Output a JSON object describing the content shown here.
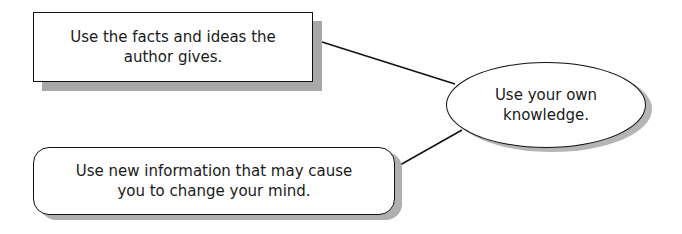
{
  "diagram": {
    "top_box": {
      "shape": "rectangle",
      "line1": "Use the facts and ideas the",
      "line2": "author gives."
    },
    "bottom_box": {
      "shape": "rounded-rectangle",
      "line1": "Use new information that may cause",
      "line2": "you to change your mind."
    },
    "center_node": {
      "shape": "ellipse",
      "line1": "Use your own",
      "line2": "knowledge."
    },
    "connectors": [
      {
        "from": "top_box",
        "to": "center_node"
      },
      {
        "from": "bottom_box",
        "to": "center_node"
      }
    ],
    "colors": {
      "stroke": "#111111",
      "shadow": "#a8a8a8",
      "fill": "#ffffff"
    }
  }
}
